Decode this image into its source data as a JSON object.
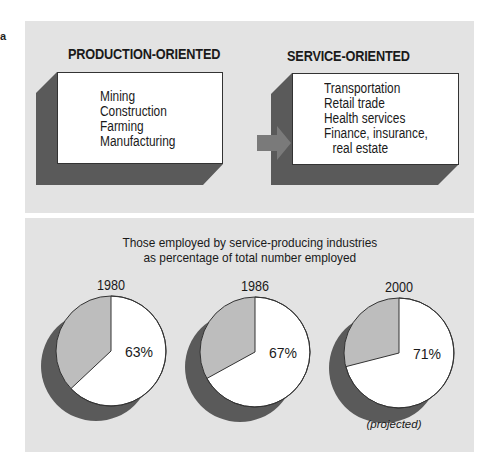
{
  "corner_mark": "a",
  "top_panel": {
    "left_heading": "PRODUCTION-ORIENTED",
    "right_heading": "SERVICE-ORIENTED",
    "left_items": [
      "Mining",
      "Construction",
      "Farming",
      "Manufacturing"
    ],
    "right_items": [
      "Transportation",
      "Retail trade",
      "Health services",
      "Finance, insurance,",
      "real estate"
    ],
    "arrow_icon": "right-arrow-icon"
  },
  "bottom_panel": {
    "title_line1": "Those employed by service-producing industries",
    "title_line2": "as percentage of total number employed",
    "note": "(projected)"
  },
  "colors": {
    "panel_bg": "#e3e3e3",
    "shadow": "#5a5a5a",
    "slice_other": "#bdbdbd",
    "slice_service": "#ffffff",
    "arrow": "#7a7a7a",
    "outline": "#333333"
  },
  "chart_data": {
    "type": "pie",
    "title": "Those employed by service-producing industries as percentage of total number employed",
    "categories": [
      "1980",
      "1986",
      "2000"
    ],
    "series": [
      {
        "name": "Service-producing",
        "values": [
          63,
          67,
          71
        ]
      },
      {
        "name": "Other",
        "values": [
          37,
          33,
          29
        ]
      }
    ],
    "labels": [
      "63%",
      "67%",
      "71%"
    ],
    "annotations": [
      {
        "category": "2000",
        "text": "(projected)"
      }
    ]
  }
}
